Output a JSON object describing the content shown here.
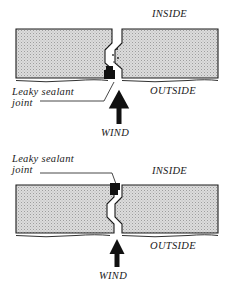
{
  "diagram": {
    "colors": {
      "panel_fill": "#d9d9d9",
      "panel_stroke": "#1a1a1a",
      "sealant": "#111111",
      "background": "#ffffff",
      "text": "#1a1a1a"
    },
    "figures": [
      {
        "id": "top",
        "name": "face-sealed-joint-section",
        "sealant_position": "outside",
        "labels": {
          "inside": "INSIDE",
          "outside": "OUTSIDE",
          "callout_line1": "Leaky sealant",
          "callout_line2": "joint",
          "wind": "WIND"
        },
        "arrow": {
          "direction": "up",
          "meaning": "wind"
        }
      },
      {
        "id": "bottom",
        "name": "inside-sealed-joint-section",
        "sealant_position": "inside",
        "labels": {
          "inside": "INSIDE",
          "outside": "OUTSIDE",
          "callout_line1": "Leaky sealant",
          "callout_line2": "joint",
          "wind": "WIND"
        },
        "arrow": {
          "direction": "up",
          "meaning": "wind"
        }
      }
    ]
  }
}
